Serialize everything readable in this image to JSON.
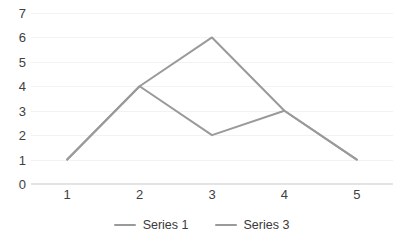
{
  "chart_data": {
    "type": "line",
    "title": "",
    "subtitle": "",
    "xlabel": "",
    "ylabel": "",
    "categories": [
      "1",
      "2",
      "3",
      "4",
      "5"
    ],
    "series": [
      {
        "name": "Series 1",
        "values": [
          1,
          4,
          6,
          3,
          1
        ],
        "color": "#9a9a9a"
      },
      {
        "name": "Series 3",
        "values": [
          1,
          4,
          2,
          3,
          1
        ],
        "color": "#9a9a9a"
      }
    ],
    "ylim": [
      0,
      7
    ],
    "y_ticks": [
      0,
      1,
      2,
      3,
      4,
      5,
      6,
      7
    ],
    "y_tick_labels": [
      "0",
      "1",
      "2",
      "3",
      "4",
      "5",
      "6",
      "7"
    ],
    "x_tick_labels": [
      "1",
      "2",
      "3",
      "4",
      "5"
    ],
    "grid": true,
    "grid_axis": "y",
    "grid_color": "#f2f2f2",
    "markers": false,
    "legend": true,
    "legend_position": "bottom",
    "axis_line_color": "#e4e4e4",
    "tick_label_color": "#404040",
    "background_color": "#ffffff",
    "line_width": 2
  }
}
